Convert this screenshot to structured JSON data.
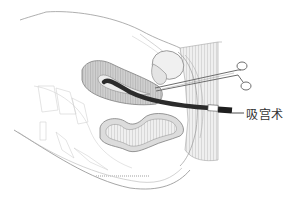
{
  "figure": {
    "type": "medical-illustration",
    "label": "吸宫术",
    "colors": {
      "background": "#ffffff",
      "outline": "#8a8a8a",
      "uterus_fill": "#c9c9c9",
      "uterus_cavity": "#ebebeb",
      "cannula": "#2b2b2b",
      "hatch": "#d8d8d8",
      "text": "#333333"
    }
  }
}
